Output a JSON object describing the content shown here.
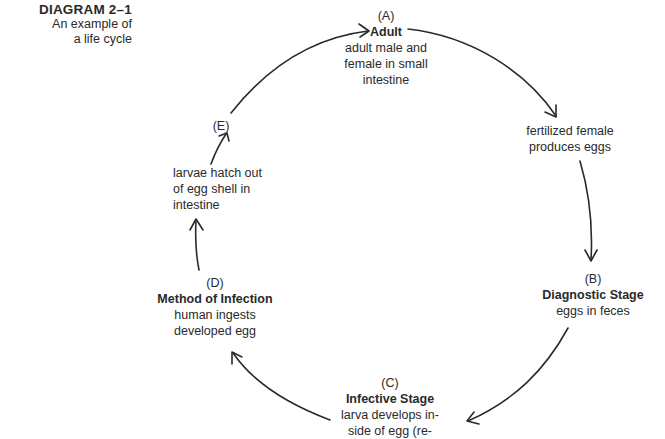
{
  "title": {
    "heading": "DIAGRAM 2–1",
    "subtitle_line1": "An example of",
    "subtitle_line2": "a life cycle"
  },
  "nodes": {
    "A": {
      "letter": "(A)",
      "stage": "Adult",
      "desc_line1": "adult male and",
      "desc_line2": "female in small",
      "desc_line3": "intestine"
    },
    "fertilized": {
      "desc_line1": "fertilized female",
      "desc_line2": "produces eggs"
    },
    "B": {
      "letter": "(B)",
      "stage": "Diagnostic Stage",
      "desc_line1": "eggs in feces"
    },
    "C": {
      "letter": "(C)",
      "stage": "Infective Stage",
      "desc_line1": "larva develops in-",
      "desc_line2": "side of egg (re-"
    },
    "D": {
      "letter": "(D)",
      "stage": "Method of Infection",
      "desc_line1": "human ingests",
      "desc_line2": "developed egg"
    },
    "E": {
      "letter": "(E)"
    },
    "hatch": {
      "desc_line1": "larvae hatch out",
      "desc_line2": "of egg shell in",
      "desc_line3": "intestine"
    }
  },
  "arrows": [
    {
      "from": "E",
      "to": "A"
    },
    {
      "from": "A",
      "to": "fertilized"
    },
    {
      "from": "fertilized",
      "to": "B"
    },
    {
      "from": "B",
      "to": "C"
    },
    {
      "from": "C",
      "to": "D"
    },
    {
      "from": "D",
      "to": "hatch"
    },
    {
      "from": "hatch",
      "to": "E"
    }
  ],
  "colors": {
    "ink": "#2a2a2a",
    "background": "#ffffff"
  }
}
